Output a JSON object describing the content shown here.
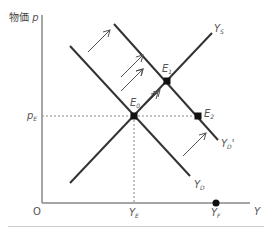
{
  "diagram": {
    "y_axis_label_jp": "物価",
    "y_axis_label_var": "p",
    "x_axis_label": "Y",
    "origin_label": "O",
    "price_level_label": {
      "main": "p",
      "sub": "E"
    },
    "ye_label": {
      "main": "Y",
      "sub": "E"
    },
    "yf_label": {
      "main": "Y",
      "sub": "F"
    },
    "curves": {
      "ys": {
        "main": "Y",
        "sub": "S"
      },
      "yd": {
        "main": "Y",
        "sub": "D"
      },
      "yd_prime": {
        "main": "Y",
        "sub": "D",
        "prime": "'"
      }
    },
    "points": {
      "e0": {
        "main": "E",
        "sub": "0"
      },
      "e1": {
        "main": "E",
        "sub": "1"
      },
      "e2": {
        "main": "E",
        "sub": "2"
      }
    },
    "colors": {
      "curve": "#333333",
      "axis": "#888888",
      "guide": "#888888",
      "point": "#111111",
      "arrow": "#555555",
      "label": "#555555"
    }
  }
}
